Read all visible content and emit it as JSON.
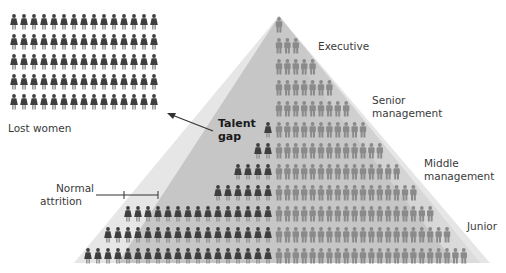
{
  "labels": {
    "executive": "Executive",
    "senior_1": "Senior",
    "senior_2": "management",
    "middle_1": "Middle",
    "middle_2": "management",
    "junior": "Junior",
    "lost_women": "Lost women",
    "talent_gap_1": "Talent",
    "talent_gap_2": "gap",
    "normal_attrition_1": "Normal",
    "normal_attrition_2": "attrition"
  },
  "colors": {
    "outer_triangle": "#e4e4e4",
    "inner_triangle": "#c4c4c4",
    "men": "#8a8a8a",
    "women": "#3e3e3e",
    "line": "#333333"
  },
  "lost_women_grid": {
    "rows": 5,
    "cols": 15
  },
  "pyramid_rows": [
    {
      "men": 1,
      "women": 0
    },
    {
      "men": 3,
      "women": 0
    },
    {
      "men": 5,
      "women": 0
    },
    {
      "men": 7,
      "women": 0
    },
    {
      "men": 9,
      "women": 0
    },
    {
      "men": 11,
      "women": 1
    },
    {
      "men": 13,
      "women": 2
    },
    {
      "men": 15,
      "women": 4
    },
    {
      "men": 17,
      "women": 6
    },
    {
      "men": 19,
      "women": 15
    },
    {
      "men": 21,
      "women": 17
    },
    {
      "men": 23,
      "women": 19
    }
  ]
}
